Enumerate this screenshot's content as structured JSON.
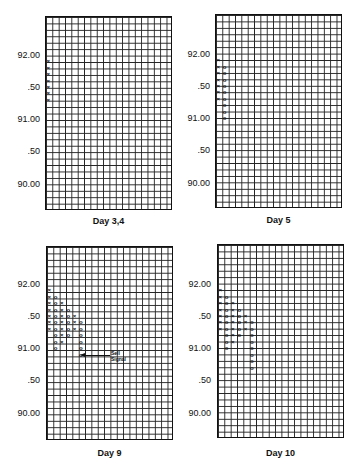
{
  "chart_data": [
    {
      "type": "point-and-figure",
      "title": "Day 3,4",
      "ylabel_ticks": [
        "92.00",
        ".50",
        "91.00",
        ".50",
        "90.00"
      ],
      "ylim": [
        89.7,
        92.6
      ],
      "box_size": 0.1,
      "columns": [
        {
          "type": "X",
          "from": 91.3,
          "to": 91.9
        }
      ]
    },
    {
      "type": "point-and-figure",
      "title": "Day 5",
      "ylabel_ticks": [
        "92.00",
        ".50",
        "91.00",
        ".50",
        "90.00"
      ],
      "ylim": [
        89.7,
        92.6
      ],
      "box_size": 0.1,
      "columns": [
        {
          "type": "X",
          "from": 91.3,
          "to": 91.9
        },
        {
          "type": "O",
          "from": 91.0,
          "to": 91.8
        }
      ]
    },
    {
      "type": "point-and-figure",
      "title": "Day 9",
      "ylabel_ticks": [
        "92.00",
        ".50",
        "91.00",
        ".50",
        "90.00"
      ],
      "ylim": [
        89.7,
        92.6
      ],
      "box_size": 0.1,
      "columns": [
        {
          "type": "X",
          "from": 91.3,
          "to": 91.9
        },
        {
          "type": "O",
          "from": 91.0,
          "to": 91.8
        },
        {
          "type": "X",
          "from": 91.1,
          "to": 91.7
        },
        {
          "type": "O",
          "from": 91.2,
          "to": 91.6
        },
        {
          "type": "X",
          "from": 91.3,
          "to": 91.5
        },
        {
          "type": "O",
          "from": 90.9,
          "to": 91.4
        }
      ],
      "annotations": [
        {
          "text": "Sell Signal",
          "arrow_to": 90.9
        }
      ]
    },
    {
      "type": "point-and-figure",
      "title": "Day 10",
      "ylabel_ticks": [
        "92.00",
        ".50",
        "91.00",
        ".50",
        "90.00"
      ],
      "ylim": [
        89.7,
        92.6
      ],
      "box_size": 0.1,
      "columns": [
        {
          "type": "X",
          "from": 91.3,
          "to": 91.9
        },
        {
          "type": "O",
          "from": 91.0,
          "to": 91.8
        },
        {
          "type": "X",
          "from": 91.1,
          "to": 91.7
        },
        {
          "type": "O",
          "from": 91.2,
          "to": 91.6
        },
        {
          "type": "X",
          "from": 91.3,
          "to": 91.5
        },
        {
          "type": "O",
          "from": 90.7,
          "to": 91.4
        }
      ]
    }
  ],
  "panels": [
    {
      "caption": "Day 3,4",
      "ticks": [
        "92.00",
        ".50",
        "91.00",
        ".50",
        "90.00"
      ]
    },
    {
      "caption": "Day 5",
      "ticks": [
        "92.00",
        ".50",
        "91.00",
        ".50",
        "90.00"
      ]
    },
    {
      "caption": "Day 9",
      "ticks": [
        "92.00",
        ".50",
        "91.00",
        ".50",
        "90.00"
      ],
      "annotation": "Sell Signal"
    },
    {
      "caption": "Day 10",
      "ticks": [
        "92.00",
        ".50",
        "91.00",
        ".50",
        "90.00"
      ]
    }
  ]
}
